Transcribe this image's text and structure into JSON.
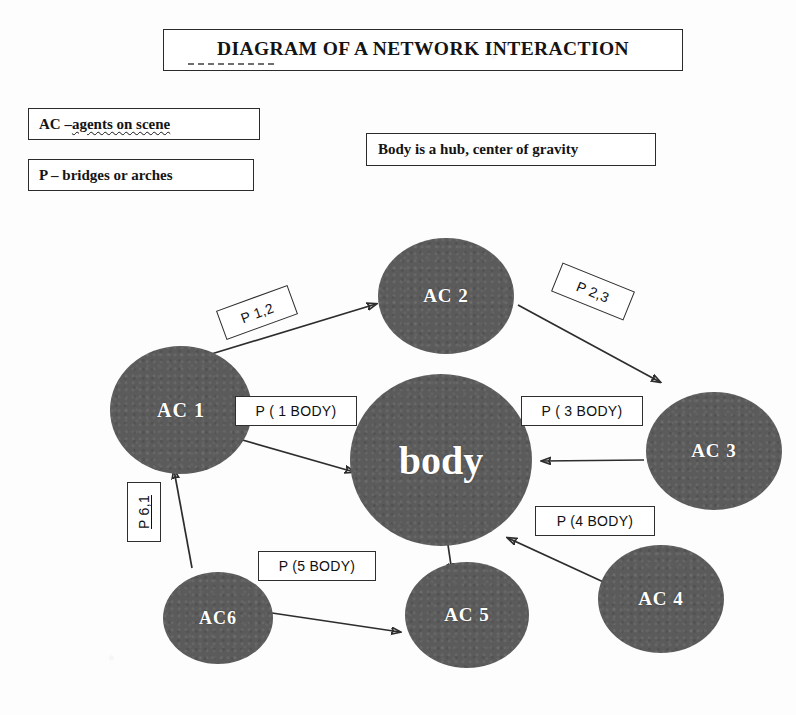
{
  "title": "DIAGRAM OF A NETWORK INTERACTION",
  "legend": {
    "ac_prefix": "AC – ",
    "ac_underlined": "agents on scene",
    "p": "P – bridges or arches",
    "body_note": "Body is a hub, center of gravity"
  },
  "nodes": [
    {
      "id": "ac1",
      "label": "AC 1"
    },
    {
      "id": "ac2",
      "label": "AC 2"
    },
    {
      "id": "ac3",
      "label": "AC 3"
    },
    {
      "id": "ac4",
      "label": "AC 4"
    },
    {
      "id": "ac5",
      "label": "AC 5"
    },
    {
      "id": "ac6",
      "label": "AC6"
    },
    {
      "id": "body",
      "label": "body"
    }
  ],
  "edge_labels": {
    "p12": "P 1,2",
    "p23": "P 2,3",
    "p61": "P 6,1",
    "p1body": "P ( 1 BODY)",
    "p3body": "P ( 3 BODY)",
    "p4body": "P (4 BODY)",
    "p5body": "P (5 BODY)"
  },
  "colors": {
    "node_fill": "#5b5b5b",
    "node_text": "#ffffff",
    "ink": "#2d2d2d",
    "paper": "#fdfdfd"
  }
}
